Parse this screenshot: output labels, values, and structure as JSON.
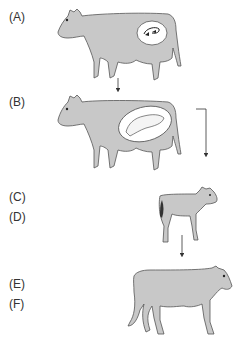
{
  "labels": {
    "a": "(A)",
    "b": "(B)",
    "c": "(C)",
    "d": "(D)",
    "e": "(E)",
    "f": "(F)"
  },
  "figures": [
    {
      "id": "adult-cow-with-embryo",
      "stage": "A",
      "description": "adult cow with early embryo in uterus"
    },
    {
      "id": "pregnant-cow-with-fetus",
      "stage": "B",
      "description": "pregnant cow with developed fetus"
    },
    {
      "id": "newborn-calf",
      "stage": "C/D",
      "description": "newborn calf"
    },
    {
      "id": "grown-heifer",
      "stage": "E/F",
      "description": "grown young cow"
    }
  ],
  "colors": {
    "body_fill": "#c8c8c8",
    "outline": "#555555",
    "womb_fill": "#ffffff",
    "text": "#333333",
    "arrow": "#333333"
  }
}
